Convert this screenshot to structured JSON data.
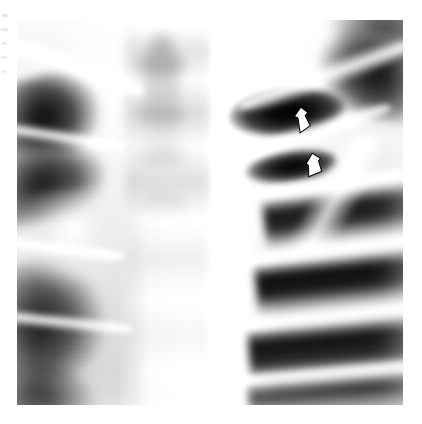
{
  "figure": {
    "kind": "chest-radiograph",
    "view": "PA upper thorax",
    "background_color": "#ffffff",
    "plate": {
      "x": 17,
      "y": 20,
      "width": 386,
      "height": 385
    },
    "tone_range": {
      "darkest": "#060606",
      "midtone": "#8f8f8f",
      "brightest": "#ffffff"
    }
  },
  "annotations": {
    "marker_color": "#ffffff",
    "outline_color": "#1a1a1a",
    "items": [
      {
        "id": "arrow-upper",
        "icon": "arrowhead-outline-icon",
        "label": "",
        "points_to": "upper cavity margin",
        "x": 292,
        "y": 105,
        "width": 20,
        "height": 28,
        "rotation": -12
      },
      {
        "id": "arrow-lower",
        "icon": "arrowhead-outline-icon",
        "label": "",
        "points_to": "lower cavity margin",
        "x": 304,
        "y": 151,
        "width": 20,
        "height": 26,
        "rotation": -6
      }
    ]
  },
  "margin_artifacts": {
    "label": "scan-edge-marks",
    "count": 5,
    "color": "#c9c9c9"
  },
  "regions": [
    {
      "name": "right-lung-field",
      "side": "image-left",
      "tone": "dark"
    },
    {
      "name": "left-lung-field",
      "side": "image-right",
      "tone": "dark"
    },
    {
      "name": "mediastinum-spine",
      "side": "center",
      "tone": "bright"
    },
    {
      "name": "cavitary-lesion",
      "side": "image-right-upper",
      "tone": "very-dark"
    }
  ]
}
